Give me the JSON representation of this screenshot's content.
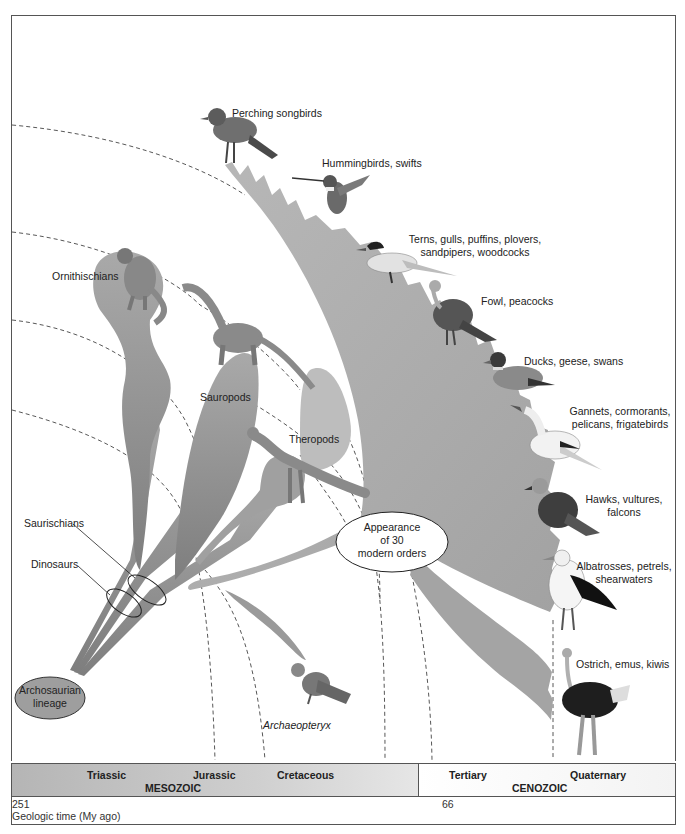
{
  "diagram": {
    "colors": {
      "branch_fill": "#aaaaaa",
      "branch_dark": "#8a8a8a",
      "blob_fill": "#bdbdbd",
      "root_fill": "#9a9a9a",
      "dashed_line": "#444444",
      "frame": "#555555"
    },
    "root": {
      "label": "Archosaurian lineage",
      "line1": "Archosaurian",
      "line2": "lineage"
    },
    "groups": {
      "ornithischians": "Ornithischians",
      "sauropods": "Sauropods",
      "theropods": "Theropods",
      "saurischians": "Saurischians",
      "dinosaurs": "Dinosaurs",
      "archaeopteryx": "Archaeopteryx"
    },
    "callout": {
      "line1": "Appearance",
      "line2": "of 30",
      "line3": "modern orders"
    },
    "bird_orders": [
      {
        "id": "perching",
        "line1": "Perching songbirds",
        "line2": ""
      },
      {
        "id": "hummingbirds",
        "line1": "Hummingbirds, swifts",
        "line2": ""
      },
      {
        "id": "terns",
        "line1": "Terns, gulls, puffins, plovers,",
        "line2": "sandpipers, woodcocks"
      },
      {
        "id": "fowl",
        "line1": "Fowl, peacocks",
        "line2": ""
      },
      {
        "id": "ducks",
        "line1": "Ducks, geese, swans",
        "line2": ""
      },
      {
        "id": "gannets",
        "line1": "Gannets, cormorants,",
        "line2": "pelicans, frigatebirds"
      },
      {
        "id": "hawks",
        "line1": "Hawks, vultures,",
        "line2": "falcons"
      },
      {
        "id": "albatrosses",
        "line1": "Albatrosses, petrels,",
        "line2": "shearwaters"
      },
      {
        "id": "ostrich",
        "line1": "Ostrich, emus, kiwis",
        "line2": ""
      }
    ]
  },
  "timeline": {
    "eras": [
      {
        "name": "MESOZOIC",
        "periods": [
          "Triassic",
          "Jurassic",
          "Cretaceous"
        ]
      },
      {
        "name": "CENOZOIC",
        "periods": [
          "Tertiary",
          "Quaternary"
        ]
      }
    ],
    "axis": {
      "start_value": "251",
      "boundary_value": "66",
      "label": "Geologic time (My ago)"
    }
  }
}
